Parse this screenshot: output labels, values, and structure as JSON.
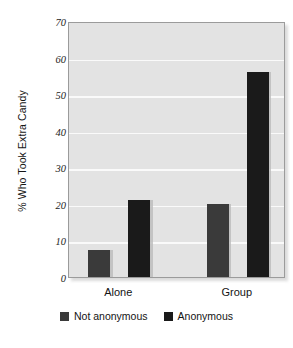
{
  "chart_data": {
    "type": "bar",
    "title": "",
    "xlabel": "",
    "ylabel": "% Who Took Extra Candy",
    "categories": [
      "Alone",
      "Group"
    ],
    "series": [
      {
        "name": "Not anonymous",
        "values": [
          7.5,
          20
        ],
        "color": "#3a3a3a"
      },
      {
        "name": "Anonymous",
        "values": [
          21,
          56
        ],
        "color": "#1a1a1a"
      }
    ],
    "ylim": [
      0,
      70
    ],
    "yticks": [
      0,
      10,
      20,
      30,
      40,
      50,
      60,
      70
    ],
    "ytick_labels": [
      "0",
      "10",
      "20",
      "30",
      "40",
      "50",
      "60",
      "70"
    ],
    "grid": "horizontal",
    "legend_position": "bottom",
    "plot_background": "#e3e3e3",
    "gridline_color": "#fafafa"
  },
  "legend": {
    "items": [
      {
        "label": "Not anonymous"
      },
      {
        "label": "Anonymous"
      }
    ]
  },
  "axis": {
    "y_title": "% Who Took Extra Candy"
  },
  "title_fragment": ""
}
